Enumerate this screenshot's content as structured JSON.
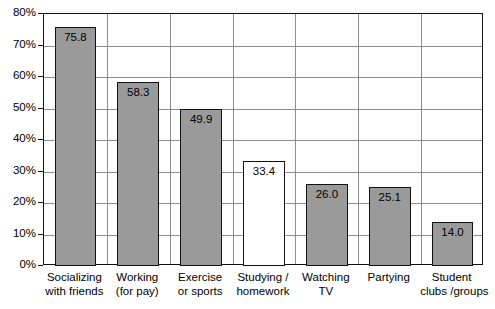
{
  "chart_data": {
    "type": "bar",
    "title": "",
    "subtitle": "",
    "xlabel": "",
    "ylabel": "",
    "categories": [
      "Socializing\nwith friends",
      "Working\n(for pay)",
      "Exercise\nor sports",
      "Studying /\nhomework",
      "Watching\nTV",
      "Partying",
      "Student\nclubs / groups"
    ],
    "category_lines": [
      [
        "Socializing",
        "with friends"
      ],
      [
        "Working",
        "(for pay)"
      ],
      [
        "Exercise",
        "or sports"
      ],
      [
        "Studying /",
        "homework"
      ],
      [
        "Watching",
        "TV"
      ],
      [
        "Partying",
        ""
      ],
      [
        "Student",
        "clubs /groups"
      ]
    ],
    "values": [
      75.8,
      58.3,
      49.9,
      33.4,
      26.0,
      25.1,
      14.0
    ],
    "value_labels": [
      "75.8",
      "58.3",
      "49.9",
      "33.4",
      "26.0",
      "25.1",
      "14.0"
    ],
    "bar_styles": [
      "filled",
      "filled",
      "filled",
      "unfilled",
      "filled",
      "filled",
      "filled"
    ],
    "ylim": [
      0,
      80
    ],
    "ytick_values": [
      0,
      10,
      20,
      30,
      40,
      50,
      60,
      70,
      80
    ],
    "ytick_labels": [
      "0%",
      "10%",
      "20%",
      "30%",
      "40%",
      "50%",
      "60%",
      "70%",
      "80%"
    ],
    "grid": {
      "horizontal": true,
      "vertical": true
    },
    "legend": {
      "visible": false,
      "position": "none"
    },
    "colors": {
      "bar_fill": "#9a9a9a",
      "bar_unfilled_fill": "#ffffff",
      "bar_border": "#111111",
      "gridline": "#8d8d8d",
      "axis": "#111111",
      "background": "#ffffff",
      "text": "#000000"
    }
  }
}
